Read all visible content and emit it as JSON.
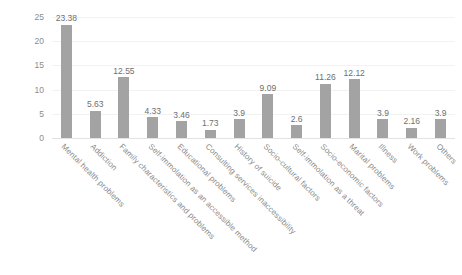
{
  "chart_data": {
    "type": "bar",
    "title": "",
    "subtitle": "",
    "xlabel": "",
    "ylabel": "",
    "ylim": [
      0,
      25
    ],
    "y_ticks": [
      "0",
      "5",
      "10",
      "15",
      "20",
      "25"
    ],
    "grid": true,
    "legend": "none",
    "orientation": "vertical",
    "bar_color": "#a3a3a3",
    "data_labels": true,
    "categories": [
      "Mental health problems",
      "Addiction",
      "Family characteristics and problems",
      "Self-immolation as an accessible method",
      "Educational problems",
      "Consulting services inaccessibility",
      "History of suicide",
      "Socio-cultural factors",
      "Self-immolation as a threat",
      "Socio-economic factors",
      "Marital problems",
      "Illness",
      "Work problems",
      "Others"
    ],
    "values": [
      23.38,
      5.63,
      12.55,
      4.33,
      3.46,
      1.73,
      3.9,
      9.09,
      2.6,
      11.26,
      12.12,
      3.9,
      2.16,
      3.9
    ],
    "value_labels": [
      "23.38",
      "5.63",
      "12.55",
      "4.33",
      "3.46",
      "1.73",
      "3.9",
      "9.09",
      "2.6",
      "11.26",
      "12.12",
      "3.9",
      "2.16",
      "3.9"
    ]
  }
}
